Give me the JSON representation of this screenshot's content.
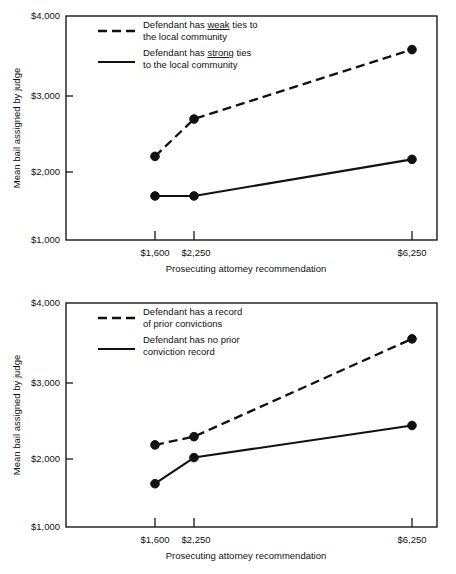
{
  "charts": [
    {
      "id": "community-ties-chart",
      "ylabel": "Mean bail assigned by judge",
      "xlabel": "Prosecuting attorney recommendation",
      "ytick_labels": [
        "$4,000",
        "$3,000",
        "$2,000",
        "$1,000"
      ],
      "xtick_labels": [
        "$1,600",
        "$2,250",
        "$6,250"
      ],
      "legend": [
        {
          "style": "dashed",
          "line1_pre": "Defendant has ",
          "line1_em": "weak",
          "line1_post": " ties to",
          "line2": "the local community",
          "full": "Defendant has weak ties to the local community"
        },
        {
          "style": "solid",
          "line1_pre": "Defendant has ",
          "line1_em": "strong",
          "line1_post": " ties",
          "line2": "to the local community",
          "full": "Defendant has strong ties to the local community"
        }
      ]
    },
    {
      "id": "prior-convictions-chart",
      "ylabel": "Mean bail assigned by judge",
      "xlabel": "Prosecuting attorney recommendation",
      "ytick_labels": [
        "$4,000",
        "$3,000",
        "$2,000",
        "$1,000"
      ],
      "xtick_labels": [
        "$1,600",
        "$2,250",
        "$6,250"
      ],
      "legend": [
        {
          "style": "dashed",
          "line1_pre": "Defendant has a record",
          "line1_em": "",
          "line1_post": "",
          "line2": "of prior convictions",
          "full": "Defendant has a record of prior convictions"
        },
        {
          "style": "solid",
          "line1_pre": "Defendant has no prior",
          "line1_em": "",
          "line1_post": "",
          "line2": "conviction record",
          "full": "Defendant has no prior conviction record"
        }
      ]
    }
  ],
  "chart_data": [
    {
      "type": "line",
      "title": "",
      "xlabel": "Prosecuting attorney recommendation",
      "ylabel": "Mean bail assigned by judge",
      "categories": [
        "$1,600",
        "$2,250",
        "$6,250"
      ],
      "x": [
        1600,
        2250,
        6250
      ],
      "ylim": [
        1000,
        4000
      ],
      "yticks": [
        1000,
        2000,
        3000,
        4000
      ],
      "ytick_labels": [
        "$1,000",
        "$2,000",
        "$3,000",
        "$4,000"
      ],
      "grid": false,
      "legend_position": "top-left-inside",
      "series": [
        {
          "name": "Defendant has weak ties to the local community",
          "style": "dashed",
          "values": [
            2120,
            2620,
            3550
          ]
        },
        {
          "name": "Defendant has strong ties to the local community",
          "style": "solid",
          "values": [
            1590,
            1590,
            2080
          ]
        }
      ]
    },
    {
      "type": "line",
      "title": "",
      "xlabel": "Prosecuting attorney recommendation",
      "ylabel": "Mean bail assigned by judge",
      "categories": [
        "$1,600",
        "$2,250",
        "$6,250"
      ],
      "x": [
        1600,
        2250,
        6250
      ],
      "ylim": [
        1000,
        4000
      ],
      "yticks": [
        1000,
        2000,
        3000,
        4000
      ],
      "ytick_labels": [
        "$1,000",
        "$2,000",
        "$3,000",
        "$4,000"
      ],
      "grid": false,
      "legend_position": "top-left-inside",
      "series": [
        {
          "name": "Defendant has a record of prior convictions",
          "style": "dashed",
          "values": [
            2100,
            2210,
            3520
          ]
        },
        {
          "name": "Defendant has no prior conviction record",
          "style": "solid",
          "values": [
            1580,
            1930,
            2360
          ]
        }
      ]
    }
  ]
}
